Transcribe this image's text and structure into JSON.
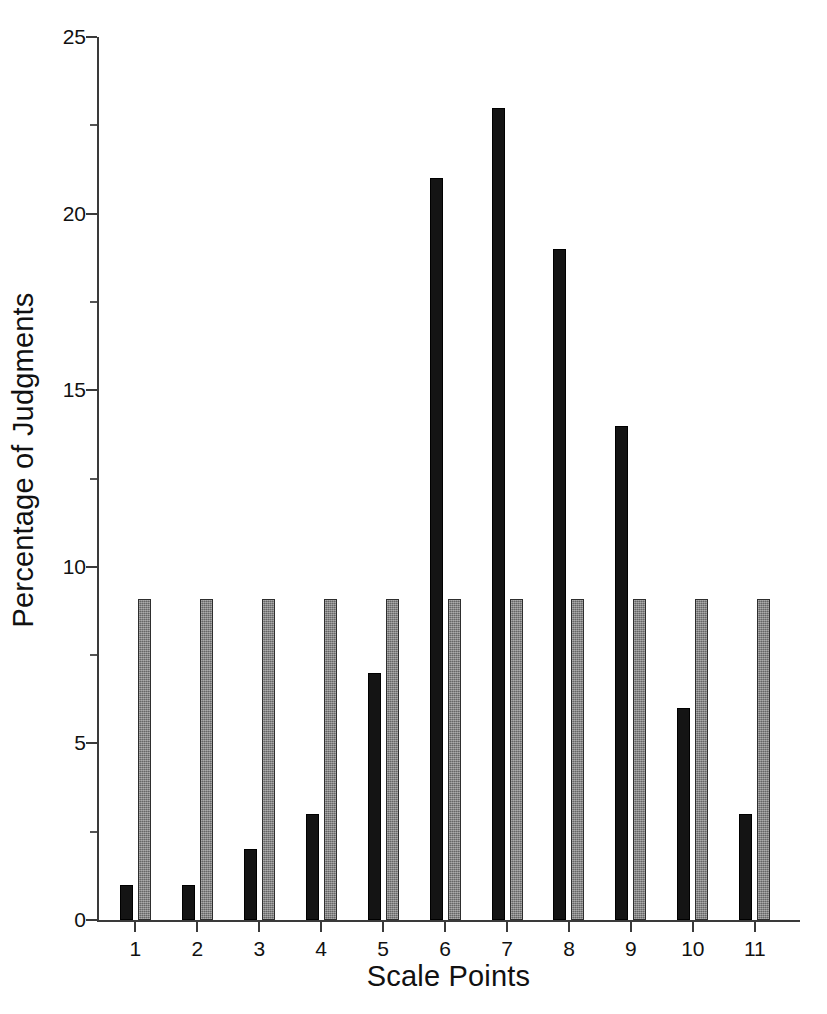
{
  "chart_data": {
    "type": "bar",
    "title": "",
    "subtitle": "",
    "xlabel": "Scale Points",
    "ylabel": "Percentage of Judgments",
    "categories": [
      "1",
      "2",
      "3",
      "4",
      "5",
      "6",
      "7",
      "8",
      "9",
      "10",
      "11"
    ],
    "series": [
      {
        "name": "Observed",
        "color": "#141414",
        "style": "solid-black",
        "values": [
          1,
          1,
          2,
          3,
          7,
          21,
          23,
          19,
          14,
          6,
          3
        ]
      },
      {
        "name": "Uniform",
        "color": "#7c7c7c",
        "style": "hatched-gray",
        "values": [
          9.1,
          9.1,
          9.1,
          9.1,
          9.1,
          9.1,
          9.1,
          9.1,
          9.1,
          9.1,
          9.1
        ]
      }
    ],
    "ylim": [
      0,
      25
    ],
    "ytick_values": [
      0,
      5,
      10,
      15,
      20,
      25
    ],
    "ytick_labels": [
      "0",
      "5",
      "10",
      "15",
      "20",
      "25"
    ],
    "yminor_tick_values": [
      2.5,
      7.5,
      12.5,
      17.5,
      22.5
    ],
    "xlim": [
      0,
      11
    ],
    "grid": false,
    "legend": null,
    "legend_position": "none",
    "annotations": []
  },
  "colors": {
    "background": "#ffffff",
    "axis": "#3a3a3a",
    "text": "#111111",
    "series_black": "#141414",
    "series_gray": "#7c7c7c"
  }
}
